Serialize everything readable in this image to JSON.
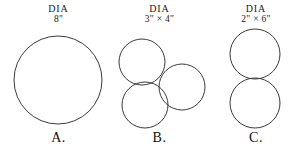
{
  "figure": {
    "background_color": "#ffffff",
    "stroke_color": "#3a3a3a",
    "dia_word": "DIA"
  },
  "groups": [
    {
      "id": "a",
      "letter": "A.",
      "dia_word": "DIA",
      "dia_value": "8\"",
      "circle_count": 1,
      "circle_diameter_inches": 8,
      "arrangement": "single",
      "circles": [
        {
          "cx": 58,
          "cy": 80,
          "r": 44
        }
      ]
    },
    {
      "id": "b",
      "letter": "B.",
      "dia_word": "DIA",
      "dia_value": "3\" × 4\"",
      "circle_count": 3,
      "circle_diameter_inches": 4,
      "arrangement": "triangular-cluster",
      "circles": [
        {
          "cx": 35,
          "cy": 62,
          "r": 23
        },
        {
          "cx": 75,
          "cy": 87,
          "r": 23
        },
        {
          "cx": 38,
          "cy": 105,
          "r": 23
        }
      ]
    },
    {
      "id": "c",
      "letter": "C.",
      "dia_word": "DIA",
      "dia_value": "2\" × 6\"",
      "circle_count": 2,
      "circle_diameter_inches": 6,
      "arrangement": "vertical-stack",
      "circles": [
        {
          "cx": 50,
          "cy": 54,
          "r": 25
        },
        {
          "cx": 50,
          "cy": 103,
          "r": 25
        }
      ]
    }
  ]
}
